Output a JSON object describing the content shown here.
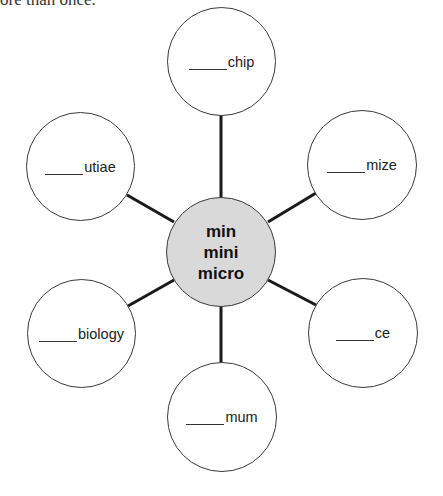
{
  "header": {
    "text": "ore than once."
  },
  "diagram": {
    "type": "word-web",
    "hub": {
      "lines": [
        "min",
        "mini",
        "micro"
      ],
      "fill": "#d9d9d9"
    },
    "nodes": [
      {
        "position": "top",
        "suffix": "chip"
      },
      {
        "position": "upper-right",
        "suffix": "mize"
      },
      {
        "position": "lower-right",
        "suffix": "ce"
      },
      {
        "position": "bottom",
        "suffix": "mum"
      },
      {
        "position": "lower-left",
        "suffix": "biology"
      },
      {
        "position": "upper-left",
        "suffix": "utiae"
      }
    ]
  }
}
